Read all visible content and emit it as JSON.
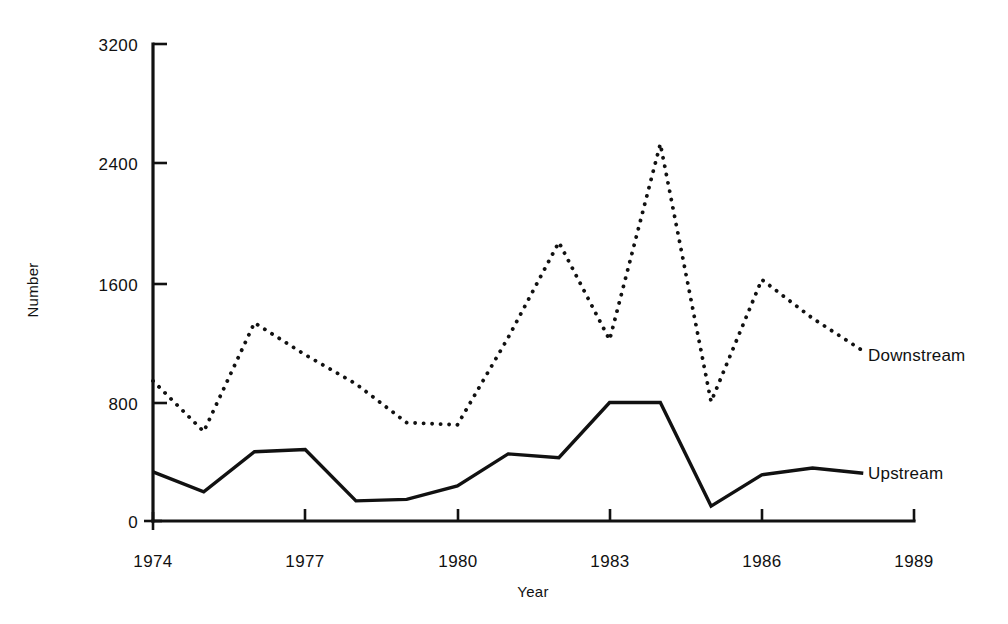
{
  "chart_data": {
    "type": "line",
    "title": "",
    "subtitle": "",
    "xlabel": "Year",
    "ylabel": "Number",
    "xlim": [
      1974,
      1989
    ],
    "ylim": [
      0,
      3200
    ],
    "grid": false,
    "legend_position": "inline-right-end-of-series",
    "x_ticks": [
      "1974",
      "1977",
      "1980",
      "1983",
      "1986",
      "1989"
    ],
    "x_tick_values": [
      1974,
      1977,
      1980,
      1983,
      1986,
      1989
    ],
    "y_ticks": [
      "0",
      "800",
      "1600",
      "2400",
      "3200"
    ],
    "y_tick_values": [
      0,
      800,
      1600,
      2400,
      3200
    ],
    "x": [
      1974,
      1975,
      1976,
      1977,
      1978,
      1979,
      1980,
      1981,
      1982,
      1983,
      1984,
      1985,
      1986,
      1987,
      1988
    ],
    "series": [
      {
        "name": "Downstream",
        "style": "dotted",
        "color": "#111111",
        "values": [
          940,
          600,
          1330,
          1115,
          920,
          660,
          645,
          1230,
          1870,
          1215,
          2530,
          800,
          1620,
          1360,
          1140
        ]
      },
      {
        "name": "Upstream",
        "style": "solid",
        "color": "#111111",
        "values": [
          330,
          195,
          465,
          480,
          135,
          145,
          235,
          450,
          425,
          795,
          795,
          100,
          310,
          355,
          320
        ]
      }
    ],
    "annotations": [
      {
        "text": "Downstream",
        "x": 1988.2,
        "y": 1120
      },
      {
        "text": "Upstream",
        "x": 1988.2,
        "y": 300
      }
    ]
  },
  "axis": {
    "y_label": "Number",
    "x_label": "Year",
    "y_tick_0": "0",
    "y_tick_800": "800",
    "y_tick_1600": "1600",
    "y_tick_2400": "2400",
    "y_tick_3200": "3200",
    "x_tick_1974": "1974",
    "x_tick_1977": "1977",
    "x_tick_1980": "1980",
    "x_tick_1983": "1983",
    "x_tick_1986": "1986",
    "x_tick_1989": "1989"
  },
  "legend": {
    "downstream": "Downstream",
    "upstream": "Upstream"
  },
  "colors": {
    "ink": "#111111",
    "background": "#ffffff"
  }
}
